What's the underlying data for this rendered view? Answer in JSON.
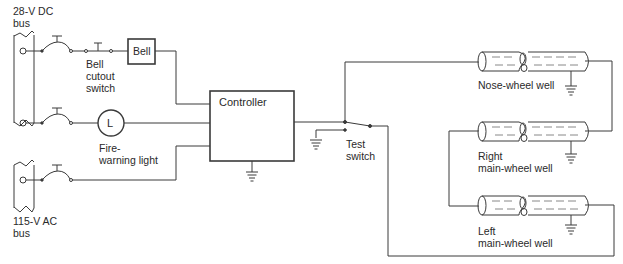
{
  "diagram": {
    "labels": {
      "dc_bus": [
        "28-V DC",
        "bus"
      ],
      "ac_bus": [
        "115-V AC",
        "bus"
      ],
      "bell": "Bell",
      "bell_cutout": [
        "Bell",
        "cutout",
        "switch"
      ],
      "fire_light_symbol": "L",
      "fire_light": [
        "Fire-",
        "warning light"
      ],
      "controller": "Controller",
      "test_switch": [
        "Test",
        "switch"
      ],
      "nose_well": "Nose-wheel well",
      "right_well": [
        "Right",
        "main-wheel well"
      ],
      "left_well": [
        "Left",
        "main-wheel well"
      ]
    },
    "colors": {
      "line": "#3a3a3a",
      "text": "#2a2a2a",
      "background": "#ffffff"
    }
  }
}
